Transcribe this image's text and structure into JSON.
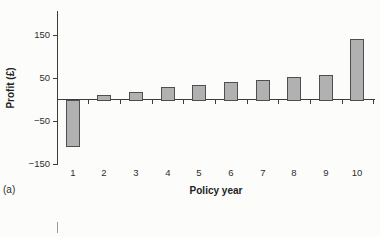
{
  "figure": {
    "panel_label": "(a)",
    "colors": {
      "bar_fill": "#b1b1b1",
      "bar_border": "#4f4f4f",
      "axis": "#3d3d3d",
      "text": "#2e2e2e",
      "background": "#fcfcfb"
    }
  },
  "chart_data": {
    "type": "bar",
    "title": "",
    "xlabel": "Policy year",
    "ylabel": "Profit (£)",
    "categories": [
      "1",
      "2",
      "3",
      "4",
      "5",
      "6",
      "7",
      "8",
      "9",
      "10"
    ],
    "values": [
      -110,
      10,
      18,
      28,
      34,
      40,
      46,
      52,
      58,
      140
    ],
    "ylim": [
      -150,
      150
    ],
    "yticks": [
      150,
      50,
      -50,
      -150
    ],
    "ytick_labels": [
      "150",
      "50",
      "−50",
      "−150"
    ],
    "grid": false,
    "legend_position": "none"
  }
}
